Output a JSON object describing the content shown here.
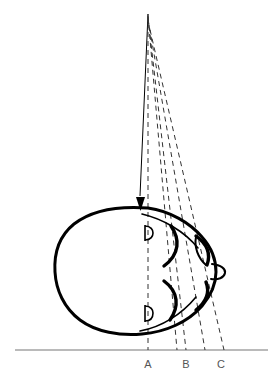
{
  "figure": {
    "type": "line-diagram",
    "background_color": "#ffffff",
    "ink_color": "#000000",
    "label_color": "#555555",
    "baseline": {
      "name": "ground-line",
      "y": 350,
      "x_start": 15,
      "x_end": 268,
      "color": "#777777",
      "stroke_width": 1.2
    },
    "apex": {
      "x": 148,
      "y": 12
    },
    "rays": [
      {
        "id": "ray-a",
        "style": "solid-with-arrow",
        "base_x": 148,
        "label": "A",
        "arrow_at": {
          "x": 148,
          "y": 207
        }
      },
      {
        "id": "ray-dashed-1",
        "style": "dashed",
        "base_x": 148,
        "label": "A"
      },
      {
        "id": "ray-dashed-2",
        "style": "dashed",
        "base_x": 177,
        "label": ""
      },
      {
        "id": "ray-dashed-3",
        "style": "dashed",
        "base_x": 186,
        "label": "B"
      },
      {
        "id": "ray-dashed-4",
        "style": "dashed",
        "base_x": 205,
        "label": ""
      },
      {
        "id": "ray-dashed-5",
        "style": "dashed",
        "base_x": 224,
        "label": "C"
      }
    ],
    "axis_labels": [
      {
        "text": "A",
        "x": 148,
        "y": 365
      },
      {
        "text": "B",
        "x": 186,
        "y": 365
      },
      {
        "text": "C",
        "x": 221,
        "y": 365
      }
    ],
    "head": {
      "name": "head-outline",
      "description": "oval head profile viewed from above, facing right",
      "bounds": {
        "left": 55,
        "top": 207,
        "right": 216,
        "bottom": 334
      },
      "stroke_width": 3
    },
    "features": [
      {
        "name": "ear-upper",
        "shape": "small-oval",
        "x": 147,
        "y": 232
      },
      {
        "name": "ear-lower",
        "shape": "small-oval",
        "x": 147,
        "y": 313
      },
      {
        "name": "cheek-arc-upper",
        "shape": "arc"
      },
      {
        "name": "cheek-arc-lower",
        "shape": "arc"
      },
      {
        "name": "eye-upper",
        "shape": "lens"
      },
      {
        "name": "eye-lower",
        "shape": "arc"
      },
      {
        "name": "nose",
        "shape": "small-protrusion",
        "x": 216,
        "y": 272
      }
    ]
  }
}
